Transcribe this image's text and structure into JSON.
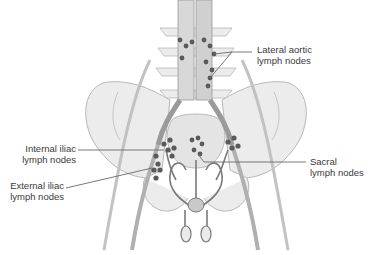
{
  "figure": {
    "colors": {
      "bone_fill": "#ececec",
      "bone_stroke": "#b8b8b8",
      "vessel": "#8a8a8a",
      "vessel_light": "#c8c8c8",
      "node": "#5a5a5a",
      "leader_line": "#6a6a6a",
      "text": "#3a3a3a"
    },
    "labels": {
      "lateral_aortic": {
        "line1": "Lateral aortic",
        "line2": "lymph nodes"
      },
      "internal_iliac": {
        "line1": "Internal iliac",
        "line2": "lymph nodes"
      },
      "external_iliac": {
        "line1": "External iliac",
        "line2": "lymph nodes"
      },
      "sacral": {
        "line1": "Sacral",
        "line2": "lymph nodes"
      }
    }
  }
}
